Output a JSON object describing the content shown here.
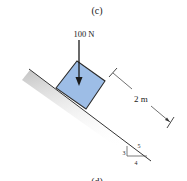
{
  "figure": {
    "part_label": "(c)",
    "next_part_label": "(d)",
    "force": {
      "label": "100 N",
      "direction": "down",
      "color": "#1a1a1a"
    },
    "block": {
      "fill": "#9dbde6",
      "stroke": "#2b2b2b"
    },
    "dimension": {
      "label": "2 m"
    },
    "slope": {
      "rise": "3",
      "run": "4",
      "hypotenuse": "5"
    },
    "incline": {
      "stroke": "#333333",
      "shadow": "#cfcfcf"
    }
  }
}
